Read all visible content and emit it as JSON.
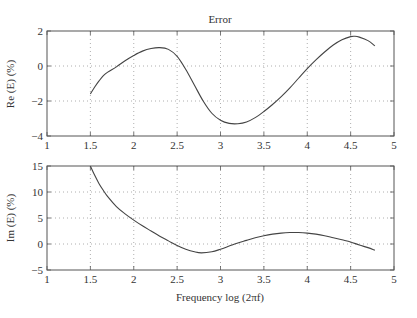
{
  "chart_data": [
    {
      "type": "line",
      "title": "Error",
      "xlabel": "",
      "ylabel": "Re (E) (%)",
      "xlim": [
        1,
        5
      ],
      "ylim": [
        -4,
        2
      ],
      "xticks": [
        1,
        1.5,
        2,
        2.5,
        3,
        3.5,
        4,
        4.5,
        5
      ],
      "xtick_labels": [
        "1",
        "1.5",
        "2",
        "2.5",
        "3",
        "3.5",
        "4",
        "4.5",
        "5"
      ],
      "yticks": [
        -4,
        -2,
        0,
        2
      ],
      "ytick_labels": [
        "−4",
        "−2",
        "0",
        "2"
      ],
      "grid": true,
      "series": [
        {
          "name": "Re(E)",
          "x": [
            1.5,
            1.55,
            1.6,
            1.65,
            1.7,
            1.8,
            1.9,
            2.0,
            2.1,
            2.2,
            2.3,
            2.4,
            2.5,
            2.6,
            2.7,
            2.8,
            2.9,
            3.0,
            3.1,
            3.2,
            3.3,
            3.4,
            3.5,
            3.6,
            3.7,
            3.8,
            3.9,
            4.0,
            4.1,
            4.2,
            4.3,
            4.4,
            4.5,
            4.55,
            4.6,
            4.7,
            4.78
          ],
          "values": [
            -1.6,
            -1.2,
            -0.85,
            -0.55,
            -0.35,
            -0.05,
            0.3,
            0.6,
            0.85,
            1.0,
            1.05,
            0.95,
            0.55,
            -0.2,
            -1.1,
            -2.0,
            -2.7,
            -3.1,
            -3.28,
            -3.3,
            -3.2,
            -2.95,
            -2.6,
            -2.2,
            -1.75,
            -1.25,
            -0.7,
            -0.15,
            0.35,
            0.8,
            1.2,
            1.5,
            1.68,
            1.7,
            1.65,
            1.45,
            1.15
          ]
        }
      ]
    },
    {
      "type": "line",
      "title": "",
      "xlabel": "Frequency  log (2πf)",
      "ylabel": "Im (E) (%)",
      "xlim": [
        1,
        5
      ],
      "ylim": [
        -5,
        15
      ],
      "xticks": [
        1,
        1.5,
        2,
        2.5,
        3,
        3.5,
        4,
        4.5,
        5
      ],
      "xtick_labels": [
        "1",
        "1.5",
        "2",
        "2.5",
        "3",
        "3.5",
        "4",
        "4.5",
        "5"
      ],
      "yticks": [
        -5,
        0,
        5,
        10,
        15
      ],
      "ytick_labels": [
        "−5",
        "0",
        "5",
        "10",
        "15"
      ],
      "grid": true,
      "series": [
        {
          "name": "Im(E)",
          "x": [
            1.5,
            1.55,
            1.6,
            1.65,
            1.7,
            1.8,
            1.9,
            2.0,
            2.1,
            2.2,
            2.3,
            2.4,
            2.5,
            2.6,
            2.7,
            2.78,
            2.9,
            3.0,
            3.1,
            3.2,
            3.3,
            3.4,
            3.5,
            3.6,
            3.7,
            3.8,
            3.9,
            4.0,
            4.1,
            4.2,
            4.3,
            4.4,
            4.5,
            4.6,
            4.7,
            4.78
          ],
          "values": [
            15.0,
            13.2,
            11.6,
            10.3,
            9.1,
            7.2,
            5.8,
            4.6,
            3.5,
            2.5,
            1.5,
            0.6,
            -0.3,
            -1.0,
            -1.5,
            -1.7,
            -1.5,
            -1.0,
            -0.4,
            0.2,
            0.7,
            1.2,
            1.6,
            1.9,
            2.1,
            2.2,
            2.2,
            2.1,
            1.9,
            1.6,
            1.2,
            0.8,
            0.4,
            -0.2,
            -0.7,
            -1.2
          ]
        }
      ]
    }
  ],
  "figure": {
    "title": "Error",
    "top_ylabel": "Re (E) (%)",
    "bottom_ylabel": "Im (E) (%)",
    "xlabel": "Frequency  log (2πf)"
  }
}
